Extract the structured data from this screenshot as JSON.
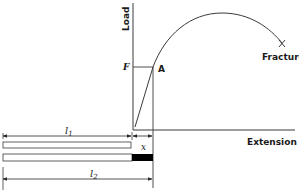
{
  "figure": {
    "type": "load-extension diagram",
    "axes": {
      "y_label": "Load",
      "x_label": "Extension"
    },
    "points": {
      "force_label": "F",
      "yield_point_label": "A",
      "fracture_label": "Fracture"
    },
    "specimen": {
      "original_length_label": "l",
      "original_length_sub": "1",
      "final_length_label": "l",
      "final_length_sub": "2",
      "extension_label": "x"
    },
    "colors": {
      "line": "#3a3a3a",
      "text": "#1a1a1a",
      "fill_extension": "#000000",
      "background": "#ffffff"
    }
  }
}
